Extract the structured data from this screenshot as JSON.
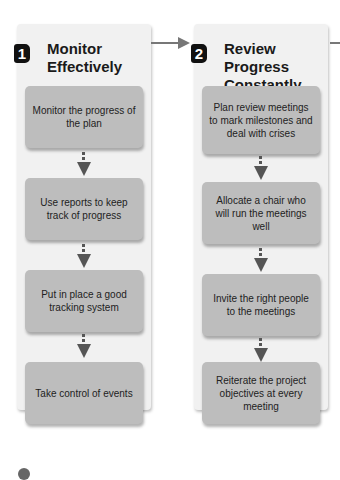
{
  "columns": [
    {
      "number": "1",
      "title_line1": "Monitor",
      "title_line2": "Effectively",
      "steps": [
        "Monitor the progress of the plan",
        "Use reports to keep track of progress",
        "Put in place a good tracking system",
        "Take control of events"
      ]
    },
    {
      "number": "2",
      "title_line1": "Review Progress",
      "title_line2": "Constantly",
      "steps": [
        "Plan review meetings to mark milestones and deal with crises",
        "Allocate a chair who will run the meetings well",
        "Invite the right people to the meetings",
        "Reiterate the project objectives at every meeting"
      ]
    }
  ],
  "colors": {
    "column_bg": "#f1f1f1",
    "box_bg": "#bdbdbd",
    "badge_bg": "#111111",
    "arrow": "#555555"
  }
}
